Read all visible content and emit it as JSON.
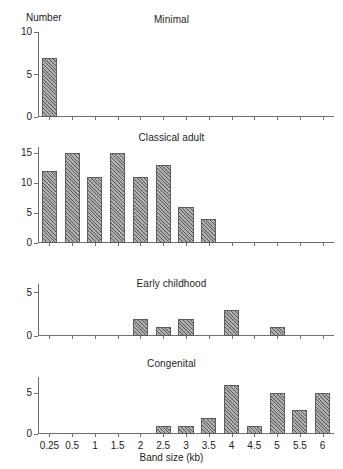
{
  "figure": {
    "y_axis_caption": "Number",
    "x_axis_caption": "Band size (kb)"
  },
  "chart_data": {
    "type": "bar",
    "title": "",
    "xlabel": "Band size (kb)",
    "ylabel": "Number",
    "grid": false,
    "legend": "none",
    "categories": [
      "0.25",
      "0.5",
      "1",
      "1.5",
      "2",
      "2.5",
      "3",
      "3.5",
      "4",
      "4.5",
      "5",
      "5.5",
      "6"
    ],
    "panels": [
      {
        "title": "Minimal",
        "ylim": [
          0,
          10
        ],
        "yticks": [
          0,
          5,
          10
        ],
        "ytick_labels": [
          "0",
          "5",
          "10"
        ],
        "values": [
          7,
          0,
          0,
          0,
          0,
          0,
          0,
          0,
          0,
          0,
          0,
          0,
          0
        ]
      },
      {
        "title": "Classical adult",
        "ylim": [
          0,
          16
        ],
        "yticks": [
          0,
          5,
          10,
          15
        ],
        "ytick_labels": [
          "0",
          "5",
          "10",
          "15"
        ],
        "values": [
          12,
          15,
          11,
          15,
          11,
          13,
          6,
          4,
          0,
          0,
          0,
          0,
          0
        ]
      },
      {
        "title": "Early childhood",
        "ylim": [
          0,
          6
        ],
        "yticks": [
          0,
          5
        ],
        "ytick_labels": [
          "0",
          "5"
        ],
        "values": [
          0,
          0,
          0,
          0,
          2,
          1,
          2,
          0,
          3,
          0,
          1,
          0,
          0
        ]
      },
      {
        "title": "Congenital",
        "ylim": [
          0,
          7
        ],
        "yticks": [
          0,
          5
        ],
        "ytick_labels": [
          "0",
          "5"
        ],
        "values": [
          0,
          0,
          0,
          0,
          0,
          1,
          1,
          2,
          6,
          1,
          5,
          3,
          5
        ]
      }
    ]
  },
  "colors": {
    "axis": "#6f6f6f",
    "bar_fill": "#b4b4b4",
    "bar_edge": "#5d5d5d",
    "text": "#1c1c1c"
  }
}
